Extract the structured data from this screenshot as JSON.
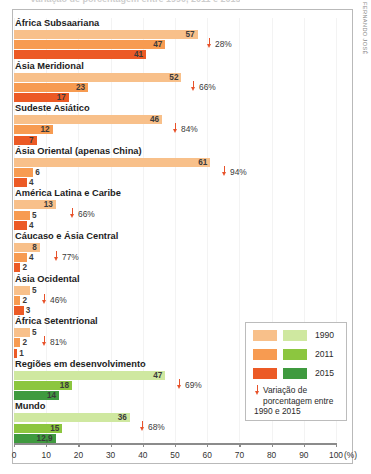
{
  "title_cut": "Variação de porcentagem entre 1990, 2011 e 2015",
  "credit": "FERNANDO JOSÉ",
  "legend": {
    "items": [
      {
        "label": "1990",
        "orange": "#f8c08a",
        "green": "#cfe8a0"
      },
      {
        "label": "2011",
        "orange": "#f79b51",
        "green": "#8cc63f"
      },
      {
        "label": "2015",
        "orange": "#ec5a25",
        "green": "#3f9a3f"
      }
    ],
    "note": "Variação de porcentagem entre 1990 e 2015",
    "arrow_icon": "down-arrow-icon"
  },
  "axis": {
    "ticks": [
      "0",
      "10",
      "20",
      "30",
      "40",
      "50",
      "60",
      "70",
      "80",
      "90",
      "100"
    ],
    "tick_values": [
      0,
      10,
      20,
      30,
      40,
      50,
      60,
      70,
      80,
      90,
      100
    ],
    "unit": "(%)",
    "min": 0,
    "max": 100
  },
  "chart_data": {
    "type": "bar",
    "title": "Variação de porcentagem entre 1990, 2011 e 2015",
    "xlabel": "(%)",
    "ylabel": "",
    "xlim": [
      0,
      100
    ],
    "orientation": "horizontal",
    "grid": false,
    "legend_position": "right-bottom",
    "categories": [
      "África Subsaariana",
      "Ásia Meridional",
      "Sudeste Asiático",
      "Ásia Oriental (apenas China)",
      "América Latina e Caribe",
      "Cáucaso e Ásia Central",
      "Ásia Ocidental",
      "África Setentrional",
      "Regiões em desenvolvimento",
      "Mundo"
    ],
    "series": [
      {
        "name": "1990",
        "values": [
          57,
          52,
          46,
          61,
          13,
          8,
          5,
          5,
          47,
          36
        ]
      },
      {
        "name": "2011",
        "values": [
          47,
          23,
          12,
          6,
          5,
          4,
          2,
          2,
          18,
          15
        ]
      },
      {
        "name": "2015",
        "values": [
          41,
          17,
          7,
          4,
          4,
          2,
          3,
          1,
          14,
          12.9
        ]
      }
    ],
    "annotations": [
      {
        "category": "África Subsaariana",
        "text": "28%"
      },
      {
        "category": "Ásia Meridional",
        "text": "66%"
      },
      {
        "category": "Sudeste Asiático",
        "text": "84%"
      },
      {
        "category": "Ásia Oriental (apenas China)",
        "text": "94%"
      },
      {
        "category": "América Latina e Caribe",
        "text": "66%"
      },
      {
        "category": "Cáucaso e Ásia Central",
        "text": "77%"
      },
      {
        "category": "Ásia Ocidental",
        "text": "46%"
      },
      {
        "category": "África Setentrional",
        "text": "81%"
      },
      {
        "category": "Regiões em desenvolvimento",
        "text": "69%"
      },
      {
        "category": "Mundo",
        "text": "68%"
      }
    ]
  },
  "groups": [
    {
      "label": "África Subsaariana",
      "palette": "orange",
      "delta": "28%",
      "delta_x": 206,
      "bars": [
        {
          "value": 57,
          "label": "57"
        },
        {
          "value": 47,
          "label": "47"
        },
        {
          "value": 41,
          "label": "41"
        }
      ]
    },
    {
      "label": "Ásia Meridional",
      "palette": "orange",
      "delta": "66%",
      "delta_x": 190,
      "bars": [
        {
          "value": 52,
          "label": "52"
        },
        {
          "value": 23,
          "label": "23"
        },
        {
          "value": 17,
          "label": "17"
        }
      ]
    },
    {
      "label": "Sudeste Asiático",
      "palette": "orange",
      "delta": "84%",
      "delta_x": 172,
      "bars": [
        {
          "value": 46,
          "label": "46"
        },
        {
          "value": 12,
          "label": "12"
        },
        {
          "value": 7,
          "label": "7"
        }
      ]
    },
    {
      "label": "Ásia Oriental (apenas China)",
      "palette": "orange",
      "delta": "94%",
      "delta_x": 221,
      "bars": [
        {
          "value": 61,
          "label": "61"
        },
        {
          "value": 6,
          "label": "6"
        },
        {
          "value": 4,
          "label": "4"
        }
      ]
    },
    {
      "label": "América Latina e Caribe",
      "palette": "orange",
      "delta": "66%",
      "delta_x": 69,
      "bars": [
        {
          "value": 13,
          "label": "13"
        },
        {
          "value": 5,
          "label": "5"
        },
        {
          "value": 4,
          "label": "4"
        }
      ]
    },
    {
      "label": "Cáucaso e Ásia Central",
      "palette": "orange",
      "delta": "77%",
      "delta_x": 53,
      "bars": [
        {
          "value": 8,
          "label": "8"
        },
        {
          "value": 4,
          "label": "4"
        },
        {
          "value": 2,
          "label": "2"
        }
      ]
    },
    {
      "label": "Ásia Ocidental",
      "palette": "orange",
      "delta": "46%",
      "delta_x": 41,
      "bars": [
        {
          "value": 5,
          "label": "5"
        },
        {
          "value": 2,
          "label": "2"
        },
        {
          "value": 3,
          "label": "3"
        }
      ]
    },
    {
      "label": "África Setentrional",
      "palette": "orange",
      "delta": "81%",
      "delta_x": 41,
      "bars": [
        {
          "value": 5,
          "label": "5"
        },
        {
          "value": 2,
          "label": "2"
        },
        {
          "value": 1,
          "label": "1"
        }
      ]
    },
    {
      "label": "Regiões em desenvolvimento",
      "palette": "green",
      "delta": "69%",
      "delta_x": 176,
      "bars": [
        {
          "value": 47,
          "label": "47"
        },
        {
          "value": 18,
          "label": "18"
        },
        {
          "value": 14,
          "label": "14"
        }
      ]
    },
    {
      "label": "Mundo",
      "palette": "green",
      "delta": "68%",
      "delta_x": 139,
      "bars": [
        {
          "value": 36,
          "label": "36"
        },
        {
          "value": 15,
          "label": "15"
        },
        {
          "value": 12.9,
          "label": "12,9"
        }
      ]
    }
  ]
}
